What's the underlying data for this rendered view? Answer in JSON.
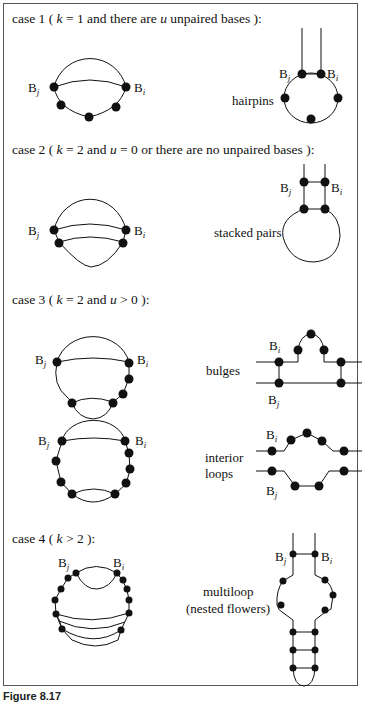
{
  "figure": {
    "caption": "Figure 8.17",
    "cases": [
      {
        "id": "case1",
        "title_prefix": "case 1 (",
        "title_k": "k",
        "title_rest": "= 1 and there are",
        "title_u": "u",
        "title_end": "unpaired bases ):",
        "label": "hairpins"
      },
      {
        "id": "case2",
        "title_prefix": "case 2 (",
        "title_k": "k",
        "title_rest": "= 2 and",
        "title_u": "u",
        "title_end": "= 0 or there are no unpaired bases ):",
        "label": "stacked pairs"
      },
      {
        "id": "case3",
        "title_prefix": "case 3 (",
        "title_k": "k",
        "title_rest": "= 2 and",
        "title_u": "u",
        "title_end": "> 0 ):",
        "label_bulges": "bulges",
        "label_interior_1": "interior",
        "label_interior_2": "loops"
      },
      {
        "id": "case4",
        "title_prefix": "case 4 (",
        "title_k": "k",
        "title_end": "> 2 ):",
        "label_1": "multiloop",
        "label_2": "(nested flowers)"
      }
    ],
    "base_labels": {
      "B": "B",
      "i": "i",
      "j": "j"
    }
  }
}
